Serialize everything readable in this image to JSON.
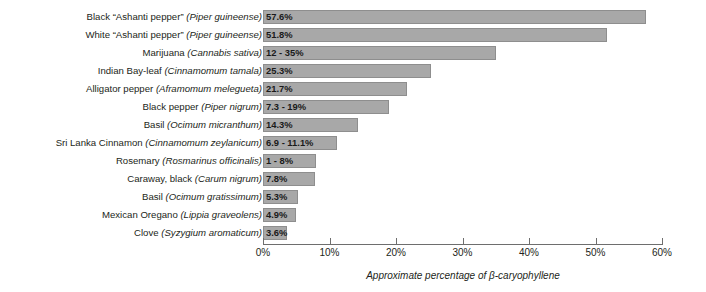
{
  "chart_data": {
    "type": "bar",
    "orientation": "horizontal",
    "title": "",
    "xlabel": "Approximate percentage of β-caryophyllene",
    "ylabel": "",
    "xlim": [
      0,
      60
    ],
    "grid": false,
    "legend": null,
    "xticks": [
      0,
      10,
      20,
      30,
      40,
      50,
      60
    ],
    "xtick_labels": [
      "0%",
      "10%",
      "20%",
      "30%",
      "40%",
      "50%",
      "60%"
    ],
    "bar_color": "#a8a8a8",
    "bar_edge_color": "#8e8e8e",
    "categories": [
      "Black \"Ashanti pepper\" (Piper guineense)",
      "White \"Ashanti pepper\" (Piper guineense)",
      "Marijuana (Cannabis sativa)",
      "Indian Bay-leaf (Cinnamomum tamala)",
      "Alligator pepper (Aframomum melegueta)",
      "Black pepper (Piper nigrum)",
      "Basil (Ocimum micranthum)",
      "Sri Lanka Cinnamon (Cinnamomum zeylanicum)",
      "Rosemary (Rosmarinus officinalis)",
      "Caraway, black (Carum nigrum)",
      "Basil (Ocimum gratissimum)",
      "Mexican Oregano (Lippia graveolens)",
      "Clove (Syzygium aromaticum)"
    ],
    "values": [
      57.6,
      51.8,
      35,
      25.3,
      21.7,
      19,
      14.3,
      11.1,
      8,
      7.8,
      5.3,
      4.9,
      3.6
    ],
    "data_labels": [
      "57.6%",
      "51.8%",
      "12 - 35%",
      "25.3%",
      "21.7%",
      "7.3 - 19%",
      "14.3%",
      "6.9 - 11.1%",
      "1 - 8%",
      "7.8%",
      "5.3%",
      "4.9%",
      "3.6%"
    ]
  },
  "rows": [
    {
      "common": "Black “Ashanti pepper”",
      "latin": "(Piper guineense)",
      "label": "57.6%",
      "value": 57.6
    },
    {
      "common": "White “Ashanti pepper”",
      "latin": "(Piper guineense)",
      "label": "51.8%",
      "value": 51.8
    },
    {
      "common": "Marijuana",
      "latin": "(Cannabis sativa)",
      "label": "12 - 35%",
      "value": 35
    },
    {
      "common": "Indian Bay-leaf",
      "latin": "(Cinnamomum tamala)",
      "label": "25.3%",
      "value": 25.3
    },
    {
      "common": "Alligator pepper",
      "latin": "(Aframomum melegueta)",
      "label": "21.7%",
      "value": 21.7
    },
    {
      "common": "Black pepper",
      "latin": "(Piper nigrum)",
      "label": "7.3 - 19%",
      "value": 19
    },
    {
      "common": "Basil",
      "latin": "(Ocimum micranthum)",
      "label": "14.3%",
      "value": 14.3
    },
    {
      "common": "Sri Lanka Cinnamon",
      "latin": "(Cinnamomum zeylanicum)",
      "label": "6.9 - 11.1%",
      "value": 11.1
    },
    {
      "common": "Rosemary",
      "latin": "(Rosmarinus officinalis)",
      "label": "1 - 8%",
      "value": 8
    },
    {
      "common": "Caraway, black",
      "latin": "(Carum nigrum)",
      "label": "7.8%",
      "value": 7.8
    },
    {
      "common": "Basil",
      "latin": "(Ocimum gratissimum)",
      "label": "5.3%",
      "value": 5.3
    },
    {
      "common": "Mexican Oregano",
      "latin": "(Lippia graveolens)",
      "label": "4.9%",
      "value": 4.9
    },
    {
      "common": "Clove",
      "latin": "(Syzygium aromaticum)",
      "label": "3.6%",
      "value": 3.6
    }
  ],
  "axis": {
    "title": "Approximate percentage of β-caryophyllene",
    "ticks": [
      "0%",
      "10%",
      "20%",
      "30%",
      "40%",
      "50%",
      "60%"
    ]
  }
}
